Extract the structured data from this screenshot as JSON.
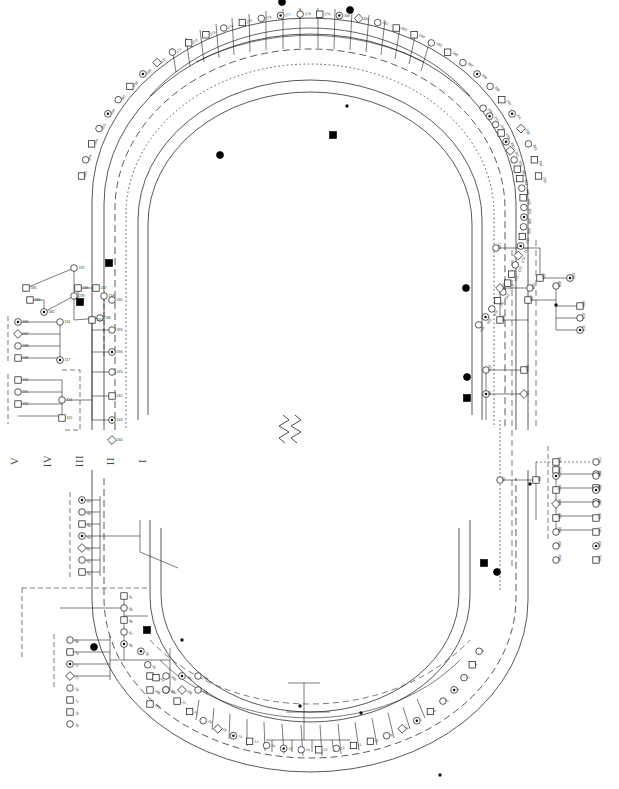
{
  "figure": {
    "type": "circular-pedigree-chart",
    "title": "",
    "background_color": "#ffffff",
    "line_color": "#1a1a1a",
    "fill_affected": "#000000",
    "fill_unaffected": "#ffffff",
    "width": 619,
    "height": 789
  },
  "generation_labels": [
    {
      "id": "gen-V",
      "label": "V",
      "x": 16,
      "y": 461
    },
    {
      "id": "gen-IV",
      "label": "IV",
      "x": 48,
      "y": 461
    },
    {
      "id": "gen-III",
      "label": "III",
      "x": 80,
      "y": 461
    },
    {
      "id": "gen-II",
      "label": "II",
      "x": 113,
      "y": 461
    },
    {
      "id": "gen-I",
      "label": "I",
      "x": 145,
      "y": 461
    }
  ],
  "legend": {
    "symbols": [
      {
        "name": "square-unaffected",
        "meaning": "male unaffected"
      },
      {
        "name": "circle-unaffected",
        "meaning": "female unaffected"
      },
      {
        "name": "square-filled",
        "meaning": "male affected"
      },
      {
        "name": "circle-filled",
        "meaning": "female affected"
      },
      {
        "name": "circle-dot",
        "meaning": "carrier"
      },
      {
        "name": "diamond",
        "meaning": "sex unknown"
      },
      {
        "name": "slash-symbol",
        "meaning": "deceased"
      },
      {
        "name": "small-dot",
        "meaning": "obligate carrier marker"
      }
    ],
    "consanguinity_prefix": "c",
    "dashed_box_meaning": "sub-family grouping"
  },
  "rings": [
    {
      "id": "ring-I",
      "style": "solid",
      "generation": "I"
    },
    {
      "id": "ring-II",
      "style": "solid",
      "generation": "II"
    },
    {
      "id": "ring-III",
      "style": "dashed",
      "generation": "III"
    },
    {
      "id": "ring-IV",
      "style": "dotted",
      "generation": "IV"
    },
    {
      "id": "ring-V",
      "style": "solid",
      "generation": "V"
    }
  ],
  "individual_ids": {
    "top_outer": [
      "262",
      "263",
      "264",
      "265",
      "266",
      "267",
      "268",
      "269",
      "270",
      "271",
      "272",
      "273",
      "274",
      "275",
      "276",
      "277",
      "278",
      "279",
      "280",
      "281",
      "282",
      "283",
      "284",
      "285",
      "286",
      "287",
      "288",
      "289",
      "290",
      "291",
      "292",
      "293",
      "294",
      "295"
    ],
    "top_right": [
      "296",
      "297",
      "298",
      "299",
      "300",
      "301",
      "302",
      "303",
      "304",
      "305",
      "306",
      "307",
      "308",
      "309",
      "310",
      "311",
      "312",
      "313",
      "314",
      "315",
      "316",
      "317",
      "318",
      "319",
      "320"
    ],
    "left_branch": [
      "583",
      "237",
      "584",
      "238",
      "585",
      "239",
      "240",
      "586",
      "587",
      "588",
      "589",
      "590",
      "591",
      "592",
      "593",
      "594",
      "241",
      "242",
      "243",
      "244",
      "245",
      "246",
      "247",
      "114",
      "115",
      "116",
      "117",
      "118"
    ],
    "right_branch": [
      "601",
      "602",
      "603",
      "604",
      "605",
      "606",
      "607",
      "608",
      "609",
      "610",
      "611",
      "612",
      "613",
      "80",
      "81",
      "82",
      "83",
      "84",
      "85",
      "86",
      "87"
    ],
    "right_lower": [
      "550",
      "551",
      "552",
      "553",
      "554",
      "555",
      "556",
      "557",
      "558",
      "559",
      "560",
      "561",
      "562",
      "563",
      "564",
      "565",
      "566"
    ],
    "bottom_left": [
      "57",
      "58",
      "59",
      "60",
      "61",
      "62",
      "63",
      "64",
      "65",
      "66",
      "67",
      "68",
      "69",
      "70",
      "71",
      "72",
      "73",
      "74",
      "75",
      "76",
      "182",
      "183",
      "184",
      "185",
      "186",
      "187",
      "188",
      "189",
      "190"
    ],
    "bottom_center": [
      "1",
      "2",
      "3",
      "4",
      "5",
      "6",
      "7",
      "8",
      "9",
      "10",
      "11",
      "12",
      "13",
      "14",
      "15",
      "16",
      "17",
      "18",
      "19",
      "20",
      "21",
      "22",
      "23",
      "24",
      "25",
      "26"
    ]
  },
  "chart_data": {
    "type": "diagram",
    "subtype": "pedigree",
    "generations": [
      "I",
      "II",
      "III",
      "IV",
      "V"
    ],
    "counts": {
      "approximate_individuals": 620,
      "affected_filled_symbols": 18,
      "carrier_dot_symbols": 40,
      "dashed_sub_family_boxes": 9
    }
  },
  "footer": {
    "watermark": ""
  }
}
